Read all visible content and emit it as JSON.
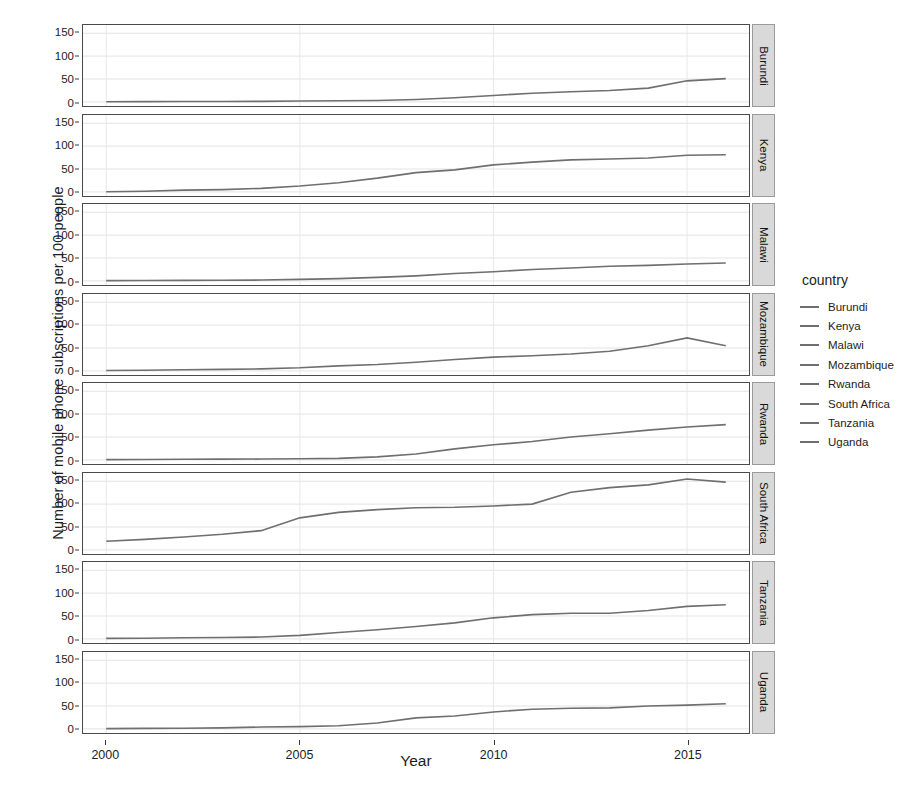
{
  "chart_data": {
    "type": "line",
    "title": "",
    "xlabel": "Year",
    "ylabel": "Number of mobile phone subscriptions per 100 people",
    "xlim": [
      1999.4,
      2016.6
    ],
    "ylim": [
      -9,
      168
    ],
    "xticks": [
      2000,
      2005,
      2010,
      2015
    ],
    "yticks": [
      0,
      50,
      100,
      150
    ],
    "grid": true,
    "facet": "country",
    "facet_strip_position": "right",
    "legend": {
      "title": "country",
      "position": "right"
    },
    "line_color": "#6f6f6f",
    "x": [
      2000,
      2001,
      2002,
      2003,
      2004,
      2005,
      2006,
      2007,
      2008,
      2009,
      2010,
      2011,
      2012,
      2013,
      2014,
      2015,
      2016
    ],
    "series": [
      {
        "name": "Burundi",
        "values": [
          0.3,
          0.5,
          0.8,
          0.9,
          1.2,
          2.0,
          2.4,
          2.9,
          5.2,
          9.0,
          14.0,
          19.0,
          22.0,
          25.0,
          30.0,
          46.0,
          50.9
        ]
      },
      {
        "name": "Kenya",
        "values": [
          0.4,
          1.3,
          3.8,
          5.0,
          7.6,
          12.8,
          20.0,
          30.0,
          42.0,
          48.0,
          59.0,
          65.0,
          70.0,
          72.0,
          74.0,
          80.0,
          81.0
        ]
      },
      {
        "name": "Malawi",
        "values": [
          0.5,
          0.8,
          1.0,
          1.3,
          1.8,
          3.3,
          5.0,
          7.6,
          11.0,
          16.0,
          20.0,
          25.0,
          28.0,
          32.0,
          34.0,
          37.0,
          39.2
        ]
      },
      {
        "name": "Mozambique",
        "values": [
          0.8,
          1.5,
          2.5,
          3.3,
          4.3,
          6.7,
          11.0,
          14.0,
          19.0,
          25.0,
          30.0,
          33.0,
          37.0,
          43.0,
          55.0,
          72.0,
          55.0
        ]
      },
      {
        "name": "Rwanda",
        "values": [
          0.5,
          0.8,
          1.4,
          1.6,
          1.8,
          2.5,
          3.4,
          6.5,
          13.0,
          24.0,
          33.0,
          40.0,
          50.0,
          57.0,
          65.0,
          72.0,
          77.0
        ]
      },
      {
        "name": "South Africa",
        "values": [
          19.0,
          23.0,
          28.0,
          34.0,
          42.0,
          70.0,
          82.0,
          88.0,
          92.0,
          93.0,
          96.0,
          100.0,
          126.0,
          136.0,
          142.0,
          155.0,
          148.0
        ]
      },
      {
        "name": "Tanzania",
        "values": [
          1.0,
          1.3,
          2.5,
          3.0,
          4.0,
          7.6,
          14.0,
          20.0,
          27.0,
          35.0,
          46.0,
          53.0,
          56.0,
          56.0,
          62.0,
          71.0,
          74.5
        ]
      },
      {
        "name": "Uganda",
        "values": [
          0.5,
          1.2,
          1.5,
          2.3,
          4.0,
          5.0,
          7.0,
          13.0,
          24.0,
          28.0,
          37.0,
          43.0,
          45.0,
          46.0,
          50.0,
          52.0,
          55.0
        ]
      }
    ]
  },
  "axes": {
    "y_title": "Number of mobile phone subscriptions per 100 people",
    "x_title": "Year",
    "y_tick_labels": [
      "150",
      "100",
      "50",
      "0"
    ],
    "x_tick_labels": [
      "2000",
      "2005",
      "2010",
      "2015"
    ]
  },
  "facets": [
    {
      "label": "Burundi"
    },
    {
      "label": "Kenya"
    },
    {
      "label": "Malawi"
    },
    {
      "label": "Mozambique"
    },
    {
      "label": "Rwanda"
    },
    {
      "label": "South Africa"
    },
    {
      "label": "Tanzania"
    },
    {
      "label": "Uganda"
    }
  ],
  "legend": {
    "title": "country",
    "items": [
      {
        "label": "Burundi",
        "color": "#6f6f6f"
      },
      {
        "label": "Kenya",
        "color": "#6f6f6f"
      },
      {
        "label": "Malawi",
        "color": "#6f6f6f"
      },
      {
        "label": "Mozambique",
        "color": "#6f6f6f"
      },
      {
        "label": "Rwanda",
        "color": "#6f6f6f"
      },
      {
        "label": "South Africa",
        "color": "#6f6f6f"
      },
      {
        "label": "Tanzania",
        "color": "#6f6f6f"
      },
      {
        "label": "Uganda",
        "color": "#6f6f6f"
      }
    ]
  }
}
